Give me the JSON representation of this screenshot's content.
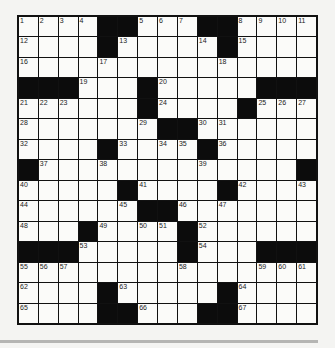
{
  "puzzle": {
    "rows": 15,
    "cols": 15,
    "grid": [
      "1,2,3,4,#,#,5,6,7,#,#,8,9,10,11",
      "12,.,.,.,#,13,.,.,.,14,#,15,.,.,.",
      "16,.,.,.,17,.,.,.,.,.,18,.,.,.,.",
      "#,#,#,19,.,.,#,20,.,.,.,.,#,#,#",
      "21,22,23,.,.,.,#,24,.,.,.,#,25,26,27",
      "28,.,.,.,.,.,29,#,#,30,31,.,.,.,.",
      "32,.,.,.,#,33,.,34,35,#,36,.,.,.,.",
      "#,37,.,.,38,.,.,.,.,39,.,.,.,.,#",
      "40,.,.,.,.,#,41,.,.,.,#,42,.,.,43",
      "44,.,.,.,.,45,#,#,46,.,47,.,.,.,.",
      "48,.,.,#,49,.,50,51,#,52,.,.,.,.,.",
      "#,#,#,53,.,.,.,.,#,54,.,.,#,#,#",
      "55,56,57,.,.,.,.,.,58,.,.,.,59,60,61",
      "62,.,.,.,#,63,.,.,.,.,#,64,.,.,.",
      "65,.,.,.,#,#,66,.,.,#,#,67,.,.,."
    ]
  },
  "colors": {
    "black_square": "#0c0c0c",
    "white_square": "#fbfbf9",
    "grid_line": "#111111",
    "rule_line": "#b5b5b3"
  }
}
